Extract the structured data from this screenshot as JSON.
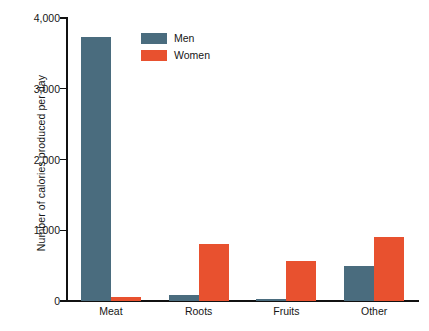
{
  "chart_data": {
    "type": "bar",
    "title": "",
    "subtitle": "",
    "xlabel": "",
    "ylabel": "Number of calories produced per day",
    "categories": [
      "Meat",
      "Roots",
      "Fruits",
      "Other"
    ],
    "series": [
      {
        "name": "Men",
        "color": "#4a6c7e",
        "values": [
          3730,
          90,
          20,
          490
        ]
      },
      {
        "name": "Women",
        "color": "#e8512f",
        "values": [
          50,
          800,
          560,
          900
        ]
      }
    ],
    "ylim": [
      0,
      4000
    ],
    "yticks": [
      0,
      1000,
      2000,
      3000,
      4000
    ],
    "ytick_labels": [
      "0",
      "1,000",
      "2,000",
      "3,000",
      "4,000"
    ],
    "grid": false,
    "legend_position": "top-center-left",
    "legend": [
      {
        "label": "Men",
        "color": "#4a6c7e"
      },
      {
        "label": "Women",
        "color": "#e8512f"
      }
    ],
    "axis_color": "#111111",
    "background": "#ffffff"
  }
}
